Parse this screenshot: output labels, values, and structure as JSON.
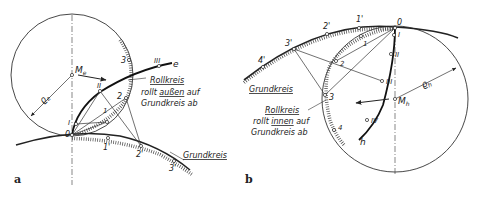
{
  "figure": {
    "panels": [
      {
        "id": "a",
        "panel_label": "a",
        "center_label": "M",
        "center_subscript": "e",
        "radius_label": "ϱ",
        "radius_subscript": "e",
        "curve_label": "e",
        "rolling_circle_points": [
          "0",
          "1",
          "2",
          "3"
        ],
        "base_circle_points": [
          "1'",
          "2'",
          "3'"
        ],
        "curve_points": [
          "I",
          "II",
          "III"
        ],
        "rollkreis_line1": "Rollkreis",
        "rollkreis_line2_pre": "rollt ",
        "rollkreis_line2_em": "außen",
        "rollkreis_line2_post": " auf",
        "rollkreis_line3": "Grundkreis ab",
        "grundkreis": "Grundkreis"
      },
      {
        "id": "b",
        "panel_label": "b",
        "center_label": "M",
        "center_subscript": "h",
        "radius_label": "ϱ",
        "radius_subscript": "h",
        "curve_label": "h",
        "rolling_circle_points": [
          "0",
          "1",
          "2",
          "3",
          "4"
        ],
        "base_circle_points": [
          "1'",
          "2'",
          "3'",
          "4'"
        ],
        "curve_points": [
          "I",
          "II",
          "III",
          "IV"
        ],
        "rollkreis_line1": "Rollkreis",
        "rollkreis_line2_pre": "rollt ",
        "rollkreis_line2_em": "innen",
        "rollkreis_line2_post": " auf",
        "rollkreis_line3": "Grundkreis ab",
        "grundkreis": "Grundkreis"
      }
    ]
  }
}
